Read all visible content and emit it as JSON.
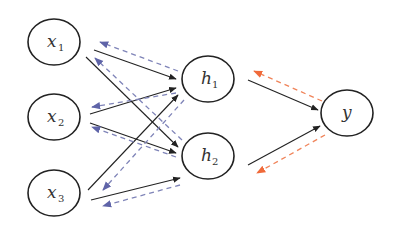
{
  "diagram": {
    "type": "neural-network-backprop",
    "colors": {
      "forward": "#222222",
      "backward_hidden": "#7f84b8",
      "backward_output": "#f0845a",
      "node_stroke": "#222222"
    },
    "nodes": [
      {
        "id": "x1",
        "base": "x",
        "sub": "1",
        "cx": 54,
        "cy": 42
      },
      {
        "id": "x2",
        "base": "x",
        "sub": "2",
        "cx": 54,
        "cy": 117
      },
      {
        "id": "x3",
        "base": "x",
        "sub": "3",
        "cx": 54,
        "cy": 193
      },
      {
        "id": "h1",
        "base": "h",
        "sub": "1",
        "cx": 208,
        "cy": 79
      },
      {
        "id": "h2",
        "base": "h",
        "sub": "2",
        "cx": 208,
        "cy": 156
      },
      {
        "id": "y",
        "base": "y",
        "sub": "",
        "cx": 347,
        "cy": 113
      }
    ],
    "forward_edges": [
      [
        "x1",
        "h1"
      ],
      [
        "x1",
        "h2"
      ],
      [
        "x2",
        "h1"
      ],
      [
        "x2",
        "h2"
      ],
      [
        "x3",
        "h1"
      ],
      [
        "x3",
        "h2"
      ],
      [
        "h1",
        "y"
      ],
      [
        "h2",
        "y"
      ]
    ],
    "backward_edges": [
      [
        "h1",
        "x1"
      ],
      [
        "h1",
        "x2"
      ],
      [
        "h1",
        "x3"
      ],
      [
        "h2",
        "x1"
      ],
      [
        "h2",
        "x2"
      ],
      [
        "h2",
        "x3"
      ],
      [
        "y",
        "h1"
      ],
      [
        "y",
        "h2"
      ]
    ]
  }
}
